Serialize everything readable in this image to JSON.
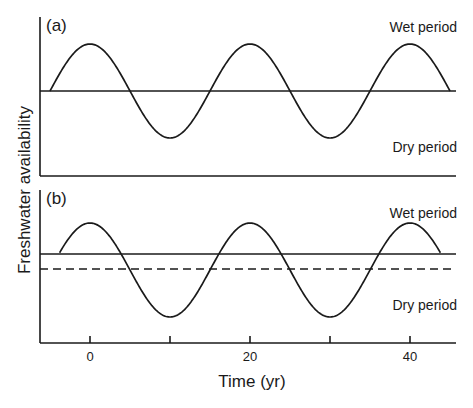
{
  "chart_data": [
    {
      "panel": "(a)",
      "type": "line",
      "title": "",
      "xlabel": "Time (yr)",
      "ylabel": "Freshwater availability",
      "x_range": [
        -5,
        45
      ],
      "x_ticks": [
        0,
        10,
        20,
        30,
        40
      ],
      "x_tick_labels": [
        "0",
        "",
        "20",
        "",
        "40"
      ],
      "grid": false,
      "series": [
        {
          "name": "Freshwater availability (sinusoidal, period 20 yr)",
          "style": "solid",
          "function": "cos(2*pi*t/20)",
          "period": 20,
          "amplitude": 1.0,
          "mean": 0.0,
          "t_start": -5,
          "t_end": 45,
          "x": [
            -5,
            0,
            5,
            10,
            15,
            20,
            25,
            30,
            35,
            40,
            45
          ],
          "values": [
            0,
            1,
            0,
            -1,
            0,
            1,
            0,
            -1,
            0,
            1,
            0
          ]
        },
        {
          "name": "Threshold (mean level)",
          "style": "solid",
          "value": 0.0
        }
      ],
      "annotations": [
        "Wet period",
        "Dry period"
      ]
    },
    {
      "panel": "(b)",
      "type": "line",
      "title": "",
      "xlabel": "Time (yr)",
      "ylabel": "Freshwater availability",
      "x_range": [
        -5,
        45
      ],
      "x_ticks": [
        0,
        10,
        20,
        30,
        40
      ],
      "x_tick_labels": [
        "0",
        "",
        "20",
        "",
        "40"
      ],
      "grid": false,
      "series": [
        {
          "name": "Freshwater availability (sinusoidal, period 20 yr)",
          "style": "solid",
          "function": "cos(2*pi*t/20)",
          "period": 20,
          "amplitude": 1.0,
          "mean": 0.0,
          "t_start": -3.8,
          "t_end": 43.8,
          "x": [
            -3.8,
            0,
            5,
            10,
            15,
            20,
            25,
            30,
            35,
            40,
            43.8
          ],
          "values": [
            0.35,
            1,
            0,
            -1,
            0,
            1,
            0,
            -1,
            0,
            1,
            0.35
          ]
        },
        {
          "name": "Raised threshold",
          "style": "solid",
          "value": 0.35
        },
        {
          "name": "Mean level",
          "style": "dashed",
          "value": 0.0
        }
      ],
      "annotations": [
        "Wet period",
        "Dry period"
      ]
    }
  ],
  "figure": {
    "ylabel": "Freshwater availability",
    "xlabel": "Time (yr)",
    "ticks": [
      {
        "t": 0,
        "label": "0"
      },
      {
        "t": 10,
        "label": ""
      },
      {
        "t": 20,
        "label": "20"
      },
      {
        "t": 30,
        "label": ""
      },
      {
        "t": 40,
        "label": "40"
      }
    ],
    "panel_a": {
      "label": "(a)",
      "wet_label": "Wet period",
      "dry_label": "Dry period"
    },
    "panel_b": {
      "label": "(b)",
      "wet_label": "Wet period",
      "dry_label": "Dry period"
    },
    "colors": {
      "line": "#1a1a1a",
      "background": "#ffffff"
    }
  }
}
